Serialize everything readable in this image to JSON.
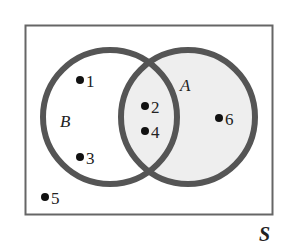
{
  "diagram": {
    "type": "venn",
    "universe_label": "S",
    "sets": [
      {
        "name": "B",
        "label": "B",
        "shaded": false
      },
      {
        "name": "A",
        "label": "A",
        "shaded": true
      }
    ],
    "elements": [
      {
        "value": "1",
        "region": "B only"
      },
      {
        "value": "3",
        "region": "B only"
      },
      {
        "value": "2",
        "region": "A and B"
      },
      {
        "value": "4",
        "region": "A and B"
      },
      {
        "value": "6",
        "region": "A only"
      },
      {
        "value": "5",
        "region": "outside"
      }
    ],
    "colors": {
      "stroke": "#555555",
      "shade": "#eeeeee"
    }
  },
  "labels": {
    "S": "S",
    "A": "A",
    "B": "B",
    "e1": "1",
    "e2": "2",
    "e3": "3",
    "e4": "4",
    "e5": "5",
    "e6": "6"
  }
}
